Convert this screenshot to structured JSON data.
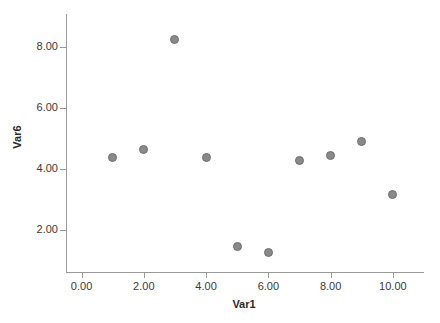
{
  "chart_data": {
    "type": "scatter",
    "title": "",
    "xlabel": "Var1",
    "ylabel": "Var6",
    "xlim": [
      -0.5,
      11.0
    ],
    "ylim": [
      0.6,
      9.1
    ],
    "grid": false,
    "legend": null,
    "x_ticks": [
      "0.00",
      "2.00",
      "4.00",
      "6.00",
      "8.00",
      "10.00"
    ],
    "x_tick_values": [
      0,
      2,
      4,
      6,
      8,
      10
    ],
    "y_ticks": [
      "2.00",
      "4.00",
      "6.00",
      "8.00"
    ],
    "y_tick_values": [
      2,
      4,
      6,
      8
    ],
    "x": [
      1,
      2,
      3,
      4,
      5,
      6,
      7,
      8,
      9,
      10
    ],
    "y": [
      4.38,
      4.65,
      8.25,
      4.36,
      1.45,
      1.25,
      4.27,
      4.45,
      4.9,
      3.15
    ],
    "points": [
      {
        "x": 1,
        "y": 4.38
      },
      {
        "x": 2,
        "y": 4.65
      },
      {
        "x": 3,
        "y": 8.25
      },
      {
        "x": 4,
        "y": 4.36
      },
      {
        "x": 5,
        "y": 1.45
      },
      {
        "x": 6,
        "y": 1.25
      },
      {
        "x": 7,
        "y": 4.27
      },
      {
        "x": 8,
        "y": 4.45
      },
      {
        "x": 9,
        "y": 4.9
      },
      {
        "x": 10,
        "y": 3.15
      }
    ],
    "marker_color": "#898989",
    "marker_edge_color": "#6f6f6f",
    "axis_color": "#9a9a9a",
    "text_color": "#3a3a3a",
    "background": "#ffffff"
  },
  "watermark": {
    "line1": "",
    "line2": ""
  }
}
